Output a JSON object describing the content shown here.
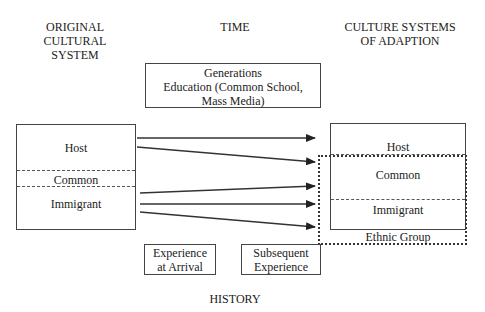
{
  "headers": {
    "original": [
      "ORIGINAL",
      "CULTURAL",
      "SYSTEM"
    ],
    "time": "TIME",
    "adaption": [
      "CULTURE SYSTEMS",
      "OF ADAPTION"
    ],
    "history": "HISTORY"
  },
  "time_box": {
    "lines": [
      "Generations",
      "Education (Common School,",
      "Mass Media)"
    ]
  },
  "original_system": {
    "host": "Host",
    "common": "Common",
    "immigrant": "Immigrant"
  },
  "adaption_system": {
    "host": "Host",
    "common": "Common",
    "immigrant": "Immigrant",
    "ethnic_group": "Ethnic Group"
  },
  "experience_boxes": {
    "arrival": [
      "Experience",
      "at Arrival"
    ],
    "subsequent": [
      "Subsequent",
      "Experience"
    ]
  },
  "arrows": [
    {
      "from": "Host",
      "to": "Host"
    },
    {
      "from": "Host",
      "to": "Ethnic Group (Common)"
    },
    {
      "from": "Immigrant",
      "to": "Common"
    },
    {
      "from": "Immigrant",
      "to": "Immigrant"
    },
    {
      "from": "Immigrant",
      "to": "Ethnic Group"
    }
  ]
}
